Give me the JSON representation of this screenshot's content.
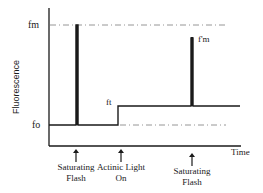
{
  "diagram": {
    "type": "fluorescence-induction-trace",
    "y_axis_label": "Fluorescence",
    "x_axis_label": "Time",
    "level_labels": {
      "fm": "fm",
      "fpm": "f'm",
      "ft": "ft",
      "fo": "fo"
    },
    "events": [
      {
        "id": "flash1",
        "label_line1": "Saturating",
        "label_line2": "Flash"
      },
      {
        "id": "actinic",
        "label_line1": "Actinic Light",
        "label_line2": "On"
      },
      {
        "id": "flash2",
        "label_line1": "Saturating",
        "label_line2": "Flash"
      }
    ],
    "colors": {
      "trace": "#1a1a1a",
      "reference_lines": "#8a8a8a",
      "background": "#ffffff"
    }
  }
}
